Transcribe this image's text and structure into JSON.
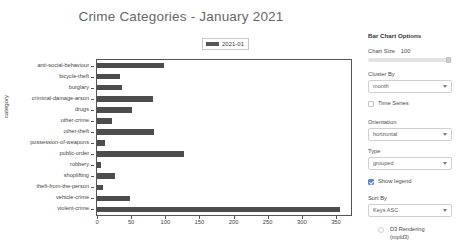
{
  "chart_data": {
    "type": "bar",
    "orientation": "horizontal",
    "title": "Crime Categories - January 2021",
    "xlabel": "",
    "ylabel": "category",
    "xlim": [
      0,
      372
    ],
    "xticks": [
      0,
      50,
      100,
      150,
      200,
      250,
      300,
      350
    ],
    "grid": false,
    "legend": [
      "2021-01"
    ],
    "legend_position": "top-center",
    "bar_color": "#4d4d4d",
    "categories": [
      "anti-social-behaviour",
      "bicycle-theft",
      "burglary",
      "criminal-damage-arson",
      "drugs",
      "other-crime",
      "other-theft",
      "possession-of-weapons",
      "public-order",
      "robbery",
      "shoplifting",
      "theft-from-the-person",
      "vehicle-crime",
      "violent-crime"
    ],
    "series": [
      {
        "name": "2021-01",
        "values": [
          98,
          34,
          37,
          82,
          51,
          22,
          83,
          11,
          127,
          6,
          27,
          9,
          48,
          356
        ]
      }
    ]
  },
  "sidebar": {
    "panel_title": "Bar Chart Options",
    "chart_size": {
      "label": "Chart Size",
      "value": "100"
    },
    "cluster_by": {
      "label": "Cluster By",
      "value": "month"
    },
    "time_series": {
      "label": "Time Series",
      "checked": false
    },
    "orientation": {
      "label": "Orientation",
      "value": "horizontal"
    },
    "type": {
      "label": "Type",
      "value": "grouped"
    },
    "show_legend": {
      "label": "Show legend",
      "checked": true
    },
    "sort_by": {
      "label": "Sort By",
      "value": "Keys ASC"
    },
    "footer": "D3 Rendering (mpld3)"
  }
}
